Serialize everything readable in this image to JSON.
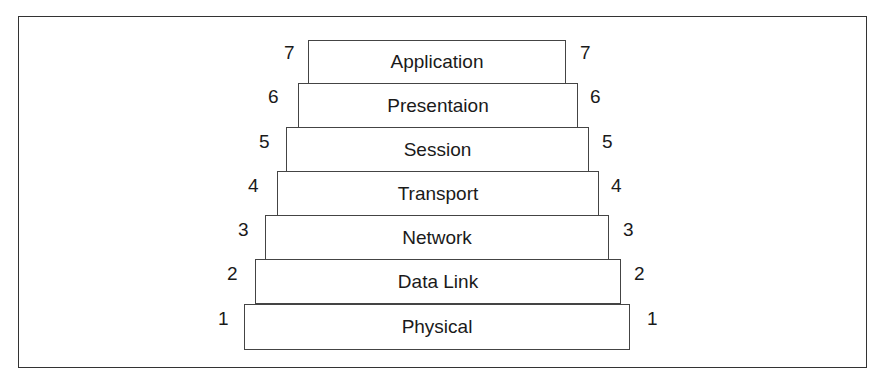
{
  "diagram": {
    "layers": [
      {
        "number": "7",
        "label": "Application"
      },
      {
        "number": "6",
        "label": "Presentaion"
      },
      {
        "number": "5",
        "label": "Session"
      },
      {
        "number": "4",
        "label": "Transport"
      },
      {
        "number": "3",
        "label": "Network"
      },
      {
        "number": "2",
        "label": "Data Link"
      },
      {
        "number": "1",
        "label": "Physical"
      }
    ]
  }
}
